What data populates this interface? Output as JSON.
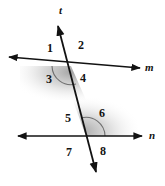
{
  "figure": {
    "kind": "geometry-diagram",
    "background_color": "#ffffff",
    "stroke_color": "#121212",
    "shade_color": "#9a9a9a",
    "line_labels": [
      {
        "id": "t",
        "text": "t",
        "x": 59,
        "y": 5
      },
      {
        "id": "m",
        "text": "m",
        "x": 145,
        "y": 62
      },
      {
        "id": "n",
        "text": "n",
        "x": 149,
        "y": 130
      }
    ],
    "angle_labels": [
      {
        "id": "angle-1",
        "text": "1",
        "x": 47,
        "y": 42
      },
      {
        "id": "angle-2",
        "text": "2",
        "x": 78,
        "y": 39
      },
      {
        "id": "angle-3",
        "text": "3",
        "x": 46,
        "y": 73
      },
      {
        "id": "angle-4",
        "text": "4",
        "x": 80,
        "y": 72
      },
      {
        "id": "angle-5",
        "text": "5",
        "x": 65,
        "y": 112
      },
      {
        "id": "angle-6",
        "text": "6",
        "x": 99,
        "y": 107
      },
      {
        "id": "angle-7",
        "text": "7",
        "x": 66,
        "y": 146
      },
      {
        "id": "angle-8",
        "text": "8",
        "x": 100,
        "y": 145
      }
    ],
    "shaded_angles": [
      "angle-3",
      "angle-6"
    ]
  }
}
